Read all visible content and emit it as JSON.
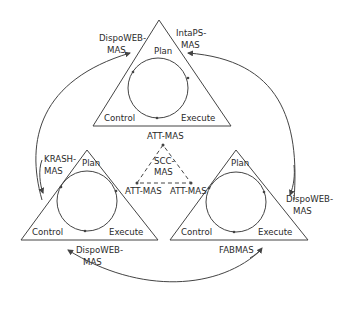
{
  "diagram": {
    "title": "",
    "colors": {
      "line": "#444444",
      "text": "#2a2a2a",
      "background": "#ffffff"
    },
    "cycles": [
      {
        "id": "top",
        "phases": {
          "plan": "Plan",
          "control": "Control",
          "execute": "Execute"
        },
        "bottom_label": "ATT-MAS"
      },
      {
        "id": "bottom-left",
        "phases": {
          "plan": "Plan",
          "control": "Control",
          "execute": "Execute"
        },
        "corner_label": "ATT-MAS"
      },
      {
        "id": "bottom-right",
        "phases": {
          "plan": "Plan",
          "control": "Control",
          "execute": "Execute"
        },
        "corner_label": "ATT-MAS"
      }
    ],
    "center": {
      "label_line1": "SCC-",
      "label_line2": "MAS"
    },
    "connections": [
      {
        "line1": "DispoWEB-",
        "line2": "MAS",
        "position": "top-left"
      },
      {
        "line1": "IntaPS-",
        "line2": "MAS",
        "position": "top-right"
      },
      {
        "line1": "KRASH-",
        "line2": "MAS",
        "position": "left"
      },
      {
        "line1": "DispoWEB-",
        "line2": "MAS",
        "position": "right"
      },
      {
        "line1": "DispoWEB-",
        "line2": "MAS",
        "position": "bottom-left"
      },
      {
        "line1": "FABMAS",
        "line2": "",
        "position": "bottom-right"
      }
    ]
  }
}
